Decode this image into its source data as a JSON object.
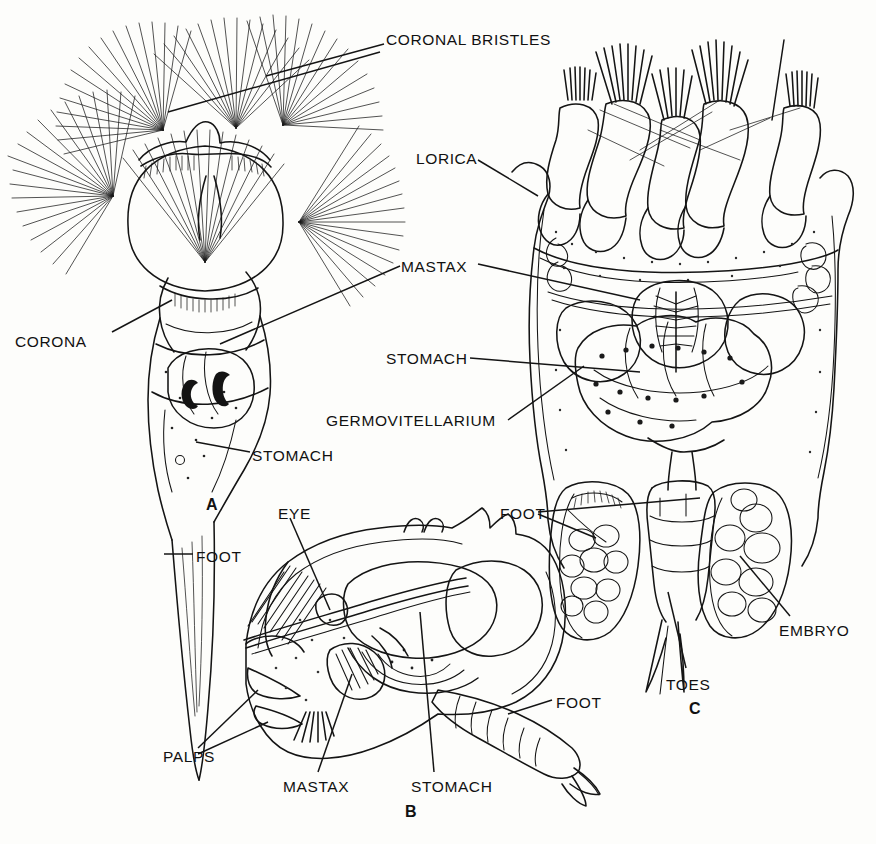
{
  "figure": {
    "kind": "scientific-line-illustration",
    "background_color": "#fdfdfb",
    "ink_color": "#141414"
  },
  "panel_letters": [
    {
      "id": "A",
      "label": "A",
      "x": 206,
      "y": 496
    },
    {
      "id": "B",
      "label": "B",
      "x": 405,
      "y": 803
    },
    {
      "id": "C",
      "label": "C",
      "x": 689,
      "y": 700
    }
  ],
  "labels": [
    {
      "name": "coronal-bristles",
      "text": "CORONAL BRISTLES",
      "x": 386,
      "y": 31,
      "panel": "A"
    },
    {
      "name": "corona",
      "text": "CORONA",
      "x": 15,
      "y": 333,
      "panel": "A"
    },
    {
      "name": "stomach-a",
      "text": "STOMACH",
      "x": 252,
      "y": 447,
      "panel": "A"
    },
    {
      "name": "foot-a",
      "text": "FOOT",
      "x": 196,
      "y": 548,
      "panel": "A"
    },
    {
      "name": "eye-b",
      "text": "EYE",
      "x": 278,
      "y": 505,
      "panel": "B"
    },
    {
      "name": "palps-b",
      "text": "PALPS",
      "x": 163,
      "y": 748,
      "panel": "B"
    },
    {
      "name": "mastax-b",
      "text": "MASTAX",
      "x": 283,
      "y": 778,
      "panel": "B"
    },
    {
      "name": "stomach-b",
      "text": "STOMACH",
      "x": 411,
      "y": 778,
      "panel": "B"
    },
    {
      "name": "foot-b",
      "text": "FOOT",
      "x": 556,
      "y": 694,
      "panel": "B"
    },
    {
      "name": "lorica-c",
      "text": "LORICA",
      "x": 416,
      "y": 150,
      "panel": "C"
    },
    {
      "name": "mastax-c",
      "text": "MASTAX",
      "x": 401,
      "y": 258,
      "panel": "C"
    },
    {
      "name": "stomach-c",
      "text": "STOMACH",
      "x": 386,
      "y": 350,
      "panel": "C"
    },
    {
      "name": "germovitellarium-c",
      "text": "GERMOVITELLARIUM",
      "x": 326,
      "y": 412,
      "panel": "C"
    },
    {
      "name": "foot-c",
      "text": "FOOT",
      "x": 500,
      "y": 505,
      "panel": "C"
    },
    {
      "name": "toes-c",
      "text": "TOES",
      "x": 666,
      "y": 676,
      "panel": "C"
    },
    {
      "name": "embryo-c",
      "text": "EMBRYO",
      "x": 779,
      "y": 622,
      "panel": "C"
    }
  ]
}
